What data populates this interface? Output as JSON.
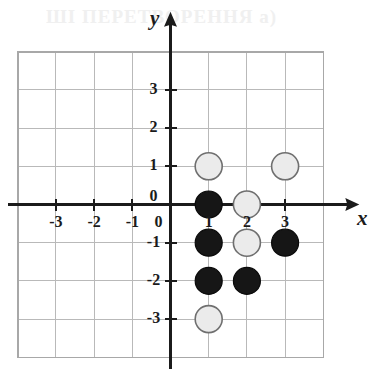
{
  "figure": {
    "ghost_text": "ШІ ПЕРЕТВОРЕННЯ     а)",
    "background_color": "#ffffff",
    "grid_color": "#b9b9b9",
    "grid_border_color": "#a8a8a8",
    "axis_color": "#1b1b1b",
    "light_fill": "#ebebeb",
    "light_stroke": "#6f6f6f",
    "dark_fill": "#161616",
    "dark_stroke": "#0a0a0a"
  },
  "chart_data": {
    "type": "scatter",
    "title": "",
    "xlabel": "x",
    "ylabel": "y",
    "xlim": [
      -4,
      4
    ],
    "ylim": [
      -4,
      4
    ],
    "grid": true,
    "legend": "none",
    "x_tick_labels": [
      "-3",
      "-2",
      "-1",
      "0"
    ],
    "x_tick_values": [
      -3,
      -2,
      -1,
      0
    ],
    "y_tick_labels": [
      "3",
      "2",
      "1",
      "0",
      "-1",
      "-2",
      "-3"
    ],
    "y_tick_values": [
      3,
      2,
      1,
      0,
      -1,
      -2,
      -3
    ],
    "origin_label": "0",
    "column_labels": [
      "1",
      "2",
      "3"
    ],
    "column_label_values": [
      1,
      2,
      3
    ],
    "series": [
      {
        "name": "light",
        "marker": "open-circle",
        "fill": "#ebebeb",
        "stroke": "#6f6f6f",
        "points": [
          {
            "x": 1,
            "y": 1
          },
          {
            "x": 3,
            "y": 1
          },
          {
            "x": 2,
            "y": 0
          },
          {
            "x": 2,
            "y": -1
          },
          {
            "x": 1,
            "y": -3
          }
        ]
      },
      {
        "name": "dark",
        "marker": "filled-circle",
        "fill": "#161616",
        "stroke": "#0a0a0a",
        "points": [
          {
            "x": 1,
            "y": 0
          },
          {
            "x": 1,
            "y": -1
          },
          {
            "x": 3,
            "y": -1
          },
          {
            "x": 1,
            "y": -2
          },
          {
            "x": 2,
            "y": -2
          }
        ]
      }
    ]
  }
}
